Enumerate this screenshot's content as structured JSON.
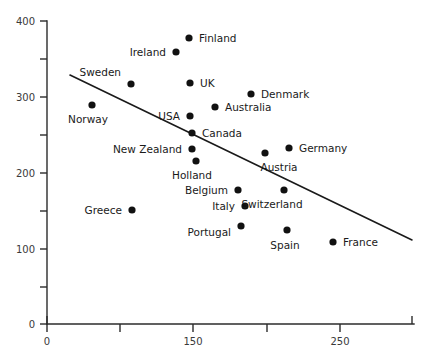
{
  "chart_data": {
    "type": "scatter",
    "title": "",
    "xlabel": "",
    "ylabel": "",
    "xlim": [
      0,
      275
    ],
    "ylim": [
      0,
      400
    ],
    "grid": false,
    "legend": "none",
    "x_ticks": [
      {
        "label": "0",
        "px": 47
      },
      {
        "label": "",
        "px": 120
      },
      {
        "label": "150",
        "px": 193
      },
      {
        "label": "",
        "px": 267
      },
      {
        "label": "250",
        "px": 340
      },
      {
        "label": "",
        "px": 412
      }
    ],
    "y_ticks": [
      {
        "label": "400",
        "px": 21
      },
      {
        "label": "",
        "px": 59
      },
      {
        "label": "300",
        "px": 97
      },
      {
        "label": "",
        "px": 135
      },
      {
        "label": "200",
        "px": 173
      },
      {
        "label": "",
        "px": 211
      },
      {
        "label": "100",
        "px": 249
      },
      {
        "label": "",
        "px": 287
      },
      {
        "label": "0",
        "px": 324
      }
    ],
    "axis": {
      "x_start_px": 47,
      "x_end_px": 414,
      "y_top_px": 21,
      "y_bottom_px": 324
    },
    "trendline": {
      "x1_px": 70,
      "y1_px": 75,
      "x2_px": 412,
      "y2_px": 240,
      "x1": 18,
      "y1": 330,
      "x2": 252,
      "y2": 110
    },
    "points": [
      {
        "name": "Norway",
        "x": 43,
        "y": 272,
        "px": 92,
        "py": 105,
        "label_dx": -4,
        "label_dy": 18,
        "anchor": "middle"
      },
      {
        "name": "Greece",
        "x": 88,
        "y": 148,
        "px": 132,
        "py": 210,
        "label_dx": -10,
        "label_dy": 4,
        "anchor": "end"
      },
      {
        "name": "Sweden",
        "x": 95,
        "y": 312,
        "px": 131,
        "py": 84,
        "label_dx": -10,
        "label_dy": -8,
        "anchor": "end"
      },
      {
        "name": "Ireland",
        "x": 138,
        "y": 355,
        "px": 176,
        "py": 52,
        "label_dx": -10,
        "label_dy": 4,
        "anchor": "end"
      },
      {
        "name": "Finland",
        "x": 147,
        "y": 375,
        "px": 189,
        "py": 38,
        "label_dx": 10,
        "label_dy": 4,
        "anchor": "start"
      },
      {
        "name": "UK",
        "x": 152,
        "y": 313,
        "px": 190,
        "py": 83,
        "label_dx": 10,
        "label_dy": 4,
        "anchor": "start"
      },
      {
        "name": "USA",
        "x": 152,
        "y": 267,
        "px": 190,
        "py": 116,
        "label_dx": -10,
        "label_dy": 4,
        "anchor": "end"
      },
      {
        "name": "Canada",
        "x": 154,
        "y": 243,
        "px": 192,
        "py": 133,
        "label_dx": 10,
        "label_dy": 4,
        "anchor": "start"
      },
      {
        "name": "New Zealand",
        "x": 154,
        "y": 230,
        "px": 192,
        "py": 149,
        "label_dx": -10,
        "label_dy": 4,
        "anchor": "end"
      },
      {
        "name": "Holland",
        "x": 157,
        "y": 213,
        "px": 196,
        "py": 161,
        "label_dx": -4,
        "label_dy": 18,
        "anchor": "middle"
      },
      {
        "name": "Australia",
        "x": 173,
        "y": 278,
        "px": 215,
        "py": 107,
        "label_dx": 10,
        "label_dy": 4,
        "anchor": "start"
      },
      {
        "name": "Denmark",
        "x": 196,
        "y": 293,
        "px": 251,
        "py": 94,
        "label_dx": 10,
        "label_dy": 4,
        "anchor": "start"
      },
      {
        "name": "Belgium",
        "x": 194,
        "y": 176,
        "px": 238,
        "py": 190,
        "label_dx": -10,
        "label_dy": 4,
        "anchor": "end"
      },
      {
        "name": "Italy",
        "x": 196,
        "y": 158,
        "px": 245,
        "py": 206,
        "label_dx": -10,
        "label_dy": 4,
        "anchor": "end"
      },
      {
        "name": "Portugal",
        "x": 194,
        "y": 130,
        "px": 241,
        "py": 226,
        "label_dx": -10,
        "label_dy": 10,
        "anchor": "end"
      },
      {
        "name": "Germany",
        "x": 211,
        "y": 231,
        "px": 289,
        "py": 148,
        "label_dx": 10,
        "label_dy": 4,
        "anchor": "start"
      },
      {
        "name": "Austria",
        "x": 203,
        "y": 224,
        "px": 265,
        "py": 153,
        "label_dx": 14,
        "label_dy": 18,
        "anchor": "middle"
      },
      {
        "name": "Switzerland",
        "x": 207,
        "y": 176,
        "px": 284,
        "py": 190,
        "label_dx": -12,
        "label_dy": 18,
        "anchor": "middle"
      },
      {
        "name": "Spain",
        "x": 207,
        "y": 120,
        "px": 287,
        "py": 230,
        "label_dx": -2,
        "label_dy": 19,
        "anchor": "middle"
      },
      {
        "name": "France",
        "x": 246,
        "y": 105,
        "px": 333,
        "py": 242,
        "label_dx": 10,
        "label_dy": 4,
        "anchor": "start"
      }
    ]
  },
  "colors": {
    "dot": "#111111",
    "line": "#1a1a1a",
    "axis": "#2b2b2b",
    "tick_label": "#3a3a3a",
    "point_label": "#1a1a1a",
    "background": "#ffffff"
  }
}
